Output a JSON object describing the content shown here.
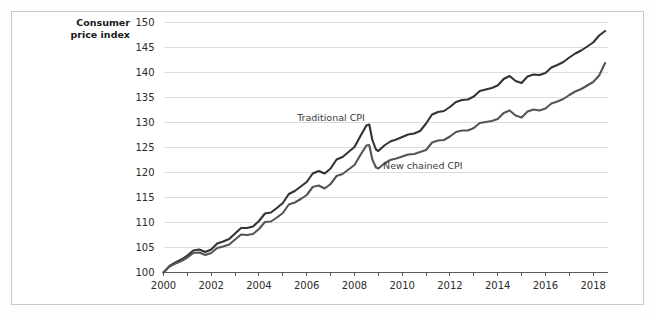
{
  "figure": {
    "background_color": "#ffffff",
    "frame_color": "#c9c9c9"
  },
  "chart_data": {
    "type": "line",
    "title": "",
    "subtitle": "",
    "xlabel": "",
    "ylabel": "Consumer\nprice index",
    "ylabel_text": "Consumer price index",
    "xlim": [
      2000,
      2018.6
    ],
    "ylim": [
      100,
      150
    ],
    "yticks": [
      100,
      105,
      110,
      115,
      120,
      125,
      130,
      135,
      140,
      145,
      150
    ],
    "ytick_labels": [
      "100",
      "105",
      "110",
      "115",
      "120",
      "125",
      "130",
      "135",
      "140",
      "145",
      "150"
    ],
    "xticks": [
      2000,
      2002,
      2004,
      2006,
      2008,
      2010,
      2012,
      2014,
      2016,
      2018
    ],
    "xtick_labels": [
      "2000",
      "2002",
      "2004",
      "2006",
      "2008",
      "2010",
      "2012",
      "2014",
      "2016",
      "2018"
    ],
    "x_minor_ticks": [
      2001,
      2003,
      2005,
      2007,
      2009,
      2011,
      2013,
      2015,
      2017
    ],
    "grid": true,
    "grid_axis": "y",
    "legend": "inline-annotations",
    "annotations": [
      {
        "text": "Traditional CPI",
        "x": 2005.6,
        "y": 130.3,
        "series": "traditional_cpi"
      },
      {
        "text": "New chained CPI",
        "x": 2009.2,
        "y": 120.7,
        "series": "new_chained_cpi"
      }
    ],
    "series": [
      {
        "name": "Traditional CPI",
        "color": "#333333",
        "line_width": 2.1,
        "x": [
          2000.0,
          2000.25,
          2000.5,
          2000.75,
          2001.0,
          2001.25,
          2001.5,
          2001.75,
          2002.0,
          2002.25,
          2002.5,
          2002.75,
          2003.0,
          2003.25,
          2003.5,
          2003.75,
          2004.0,
          2004.25,
          2004.5,
          2004.75,
          2005.0,
          2005.25,
          2005.5,
          2005.75,
          2006.0,
          2006.25,
          2006.5,
          2006.75,
          2007.0,
          2007.25,
          2007.5,
          2007.75,
          2008.0,
          2008.25,
          2008.5,
          2008.62,
          2008.75,
          2008.9,
          2009.0,
          2009.25,
          2009.5,
          2009.75,
          2010.0,
          2010.25,
          2010.5,
          2010.75,
          2011.0,
          2011.25,
          2011.5,
          2011.75,
          2012.0,
          2012.25,
          2012.5,
          2012.75,
          2013.0,
          2013.25,
          2013.5,
          2013.75,
          2014.0,
          2014.25,
          2014.5,
          2014.75,
          2015.0,
          2015.25,
          2015.5,
          2015.75,
          2016.0,
          2016.25,
          2016.5,
          2016.75,
          2017.0,
          2017.25,
          2017.5,
          2017.75,
          2018.0,
          2018.25,
          2018.5
        ],
        "values": [
          100.0,
          101.3,
          102.0,
          102.6,
          103.4,
          104.4,
          104.6,
          104.1,
          104.6,
          105.8,
          106.2,
          106.7,
          107.8,
          108.9,
          108.9,
          109.2,
          110.3,
          111.8,
          112.0,
          112.9,
          113.9,
          115.7,
          116.3,
          117.2,
          118.1,
          119.8,
          120.3,
          119.8,
          120.8,
          122.6,
          123.1,
          124.1,
          125.1,
          127.3,
          129.4,
          129.6,
          126.5,
          124.6,
          124.3,
          125.4,
          126.2,
          126.6,
          127.1,
          127.6,
          127.8,
          128.3,
          129.8,
          131.6,
          132.1,
          132.3,
          133.1,
          134.1,
          134.5,
          134.6,
          135.2,
          136.3,
          136.6,
          136.9,
          137.4,
          138.7,
          139.3,
          138.3,
          137.9,
          139.2,
          139.6,
          139.5,
          139.9,
          141.0,
          141.5,
          142.1,
          143.0,
          143.8,
          144.4,
          145.2,
          146.0,
          147.4,
          148.3
        ]
      },
      {
        "name": "New chained CPI",
        "color": "#555555",
        "line_width": 2.1,
        "x": [
          2000.0,
          2000.25,
          2000.5,
          2000.75,
          2001.0,
          2001.25,
          2001.5,
          2001.75,
          2002.0,
          2002.25,
          2002.5,
          2002.75,
          2003.0,
          2003.25,
          2003.5,
          2003.75,
          2004.0,
          2004.25,
          2004.5,
          2004.75,
          2005.0,
          2005.25,
          2005.5,
          2005.75,
          2006.0,
          2006.25,
          2006.5,
          2006.75,
          2007.0,
          2007.25,
          2007.5,
          2007.75,
          2008.0,
          2008.25,
          2008.5,
          2008.62,
          2008.75,
          2008.9,
          2009.0,
          2009.25,
          2009.5,
          2009.75,
          2010.0,
          2010.25,
          2010.5,
          2010.75,
          2011.0,
          2011.25,
          2011.5,
          2011.75,
          2012.0,
          2012.25,
          2012.5,
          2012.75,
          2013.0,
          2013.25,
          2013.5,
          2013.75,
          2014.0,
          2014.25,
          2014.5,
          2014.75,
          2015.0,
          2015.25,
          2015.5,
          2015.75,
          2016.0,
          2016.25,
          2016.5,
          2016.75,
          2017.0,
          2017.25,
          2017.5,
          2017.75,
          2018.0,
          2018.25,
          2018.5
        ],
        "values": [
          100.0,
          101.2,
          101.8,
          102.3,
          103.0,
          103.9,
          104.0,
          103.5,
          103.9,
          104.9,
          105.2,
          105.6,
          106.6,
          107.6,
          107.5,
          107.7,
          108.7,
          110.1,
          110.2,
          111.0,
          111.9,
          113.6,
          114.0,
          114.7,
          115.5,
          117.1,
          117.4,
          116.8,
          117.7,
          119.3,
          119.7,
          120.6,
          121.5,
          123.5,
          125.4,
          125.5,
          122.6,
          121.0,
          120.8,
          121.8,
          122.5,
          122.8,
          123.2,
          123.6,
          123.7,
          124.1,
          124.5,
          126.0,
          126.4,
          126.5,
          127.2,
          128.1,
          128.4,
          128.4,
          128.9,
          129.9,
          130.1,
          130.3,
          130.7,
          131.9,
          132.4,
          131.4,
          131.0,
          132.2,
          132.6,
          132.4,
          132.8,
          133.8,
          134.2,
          134.7,
          135.5,
          136.2,
          136.7,
          137.4,
          138.1,
          139.4,
          141.9
        ]
      }
    ]
  }
}
